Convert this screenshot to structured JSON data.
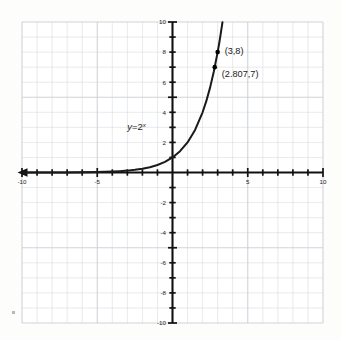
{
  "chart_data": {
    "type": "line",
    "title": "",
    "subtitle": "",
    "xlabel": "",
    "ylabel": "",
    "xlim": [
      -10,
      10
    ],
    "ylim": [
      -10,
      10
    ],
    "grid": true,
    "grid_step": 1,
    "legend_position": "none",
    "function_expression": "y=2^x",
    "function_label": {
      "y_part": "y",
      "equals_part": "=2",
      "exponent_part": "x",
      "x_value": -3.0,
      "y_value": 2.8
    },
    "x_ticks": [
      -10,
      -5,
      5,
      10
    ],
    "x_tick_labels": [
      "-10",
      "-5",
      "5",
      "10"
    ],
    "y_ticks": [
      -10,
      -8,
      -6,
      -4,
      -2,
      2,
      4,
      6,
      8,
      10
    ],
    "y_tick_labels": [
      "-10",
      "-8",
      "-6",
      "-4",
      "-2",
      "2",
      "4",
      "6",
      "8",
      "10"
    ],
    "series": [
      {
        "name": "y=2^x",
        "color": "#1a1a1a",
        "x": [
          -10,
          -9,
          -8,
          -7,
          -6,
          -5,
          -4.5,
          -4,
          -3.5,
          -3,
          -2.5,
          -2,
          -1.5,
          -1,
          -0.5,
          0,
          0.5,
          1,
          1.5,
          2,
          2.25,
          2.5,
          2.75,
          3,
          3.1,
          3.2,
          3.32
        ],
        "y": [
          0.00098,
          0.00195,
          0.0039,
          0.0078,
          0.0156,
          0.03125,
          0.0442,
          0.0625,
          0.0884,
          0.125,
          0.1768,
          0.25,
          0.3536,
          0.5,
          0.7071,
          1,
          1.4142,
          2,
          2.8284,
          4,
          4.7568,
          5.6569,
          6.7272,
          8,
          8.5742,
          9.1896,
          9.9846
        ]
      }
    ],
    "points": [
      {
        "label": "(3,8)",
        "x": 3,
        "y": 8,
        "marker": "dot"
      },
      {
        "label": "(2.807,7)",
        "x": 2.807,
        "y": 7,
        "marker": "dot"
      }
    ],
    "axes": {
      "x_axis_arrow_left": true,
      "x_axis_arrow_right": false,
      "y_axis_arrow_top": false,
      "y_axis_arrow_bottom": false,
      "axis_color": "#111111",
      "grid_color": "#c9cdd4"
    },
    "background_color": "#fdfdfc",
    "plot_area_color": "#ffffff"
  }
}
